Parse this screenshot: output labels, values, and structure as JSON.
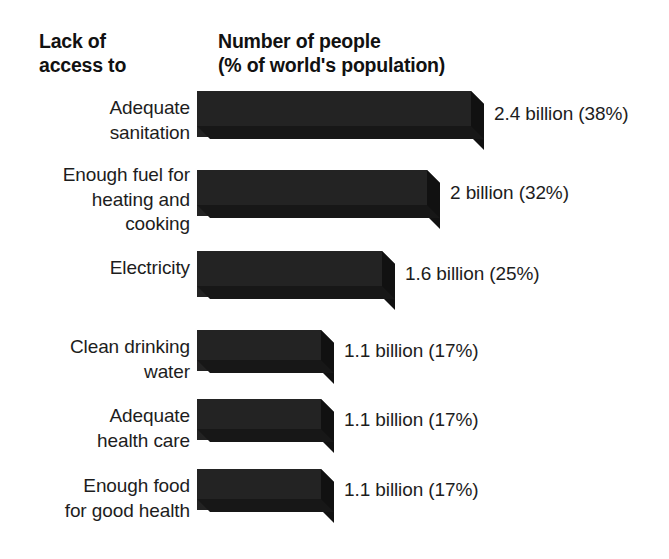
{
  "header": {
    "left": "Lack of\naccess to",
    "right": "Number of people\n(% of world's population)"
  },
  "colors": {
    "bar_front": "#232323",
    "bar_top": "#3a3a3a",
    "bar_side": "#111111",
    "bar_bottom": "#171717",
    "background": "#ffffff",
    "text": "#1d1d1d"
  },
  "chart_data": {
    "type": "bar",
    "orientation": "horizontal",
    "title": "Number of people (% of world's population)",
    "category_axis_title": "Lack of access to",
    "xlabel": "",
    "ylabel": "",
    "grid": false,
    "legend": "none",
    "xlim": [
      0,
      40
    ],
    "categories": [
      "Adequate\nsanitation",
      "Enough fuel for\nheating and\ncooking",
      "Electricity",
      "Clean drinking\nwater",
      "Adequate\nhealth care",
      "Enough food\nfor good health"
    ],
    "values": [
      38,
      32,
      25,
      17,
      17,
      17
    ],
    "value_unit": "% of world's population",
    "people_billions": [
      2.4,
      2,
      1.6,
      1.1,
      1.1,
      1.1
    ],
    "data_labels": [
      "2.4 billion (38%)",
      "2 billion (32%)",
      "1.6 billion (25%)",
      "1.1 billion (17%)",
      "1.1 billion (17%)",
      "1.1 billion (17%)"
    ]
  },
  "bars": [
    {
      "label": "Adequate\nsanitation",
      "value_label": "2.4 billion (38%)",
      "percent": 38,
      "top": 91,
      "label_top": 96,
      "width": 274,
      "height": 46
    },
    {
      "label": "Enough fuel for\nheating and\ncooking",
      "value_label": "2 billion (32%)",
      "percent": 32,
      "top": 170,
      "label_top": 163,
      "width": 230,
      "height": 46
    },
    {
      "label": "Electricity",
      "value_label": "1.6 billion (25%)",
      "percent": 25,
      "top": 251,
      "label_top": 256,
      "width": 185,
      "height": 46
    },
    {
      "label": "Clean drinking\nwater",
      "value_label": "1.1 billion (17%)",
      "percent": 17,
      "top": 330,
      "label_top": 335,
      "width": 124,
      "height": 41
    },
    {
      "label": "Adequate\nhealth care",
      "value_label": "1.1 billion (17%)",
      "percent": 17,
      "top": 399,
      "label_top": 404,
      "width": 124,
      "height": 41
    },
    {
      "label": "Enough food\nfor good health",
      "value_label": "1.1 billion (17%)",
      "percent": 17,
      "top": 469,
      "label_top": 474,
      "width": 124,
      "height": 41
    }
  ]
}
